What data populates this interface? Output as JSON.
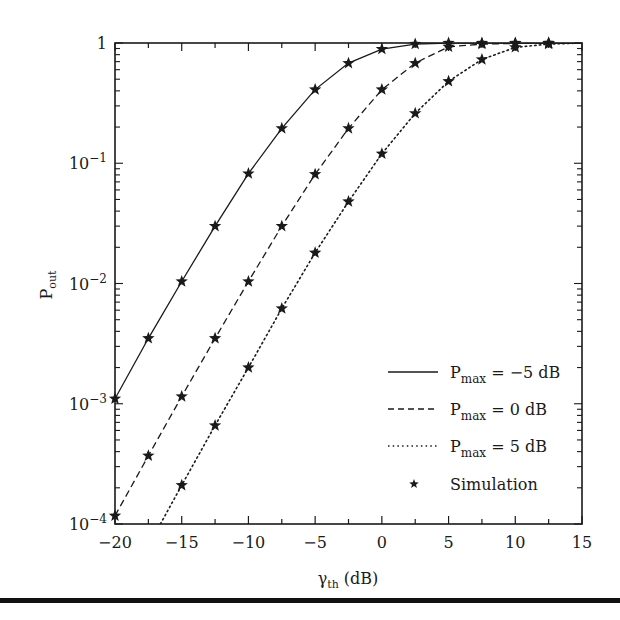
{
  "chart_data": {
    "type": "line",
    "title": "",
    "xlabel": "γth (dB)",
    "xlabel_main": "γ",
    "xlabel_sub": "th",
    "xlabel_unit": " (dB)",
    "ylabel": "Pout",
    "ylabel_main": "P",
    "ylabel_sub": "out",
    "xlim": [
      -20,
      15
    ],
    "ylim": [
      0.0001,
      1
    ],
    "yscale": "log",
    "xticks": [
      -20,
      -15,
      -10,
      -5,
      0,
      5,
      10,
      15
    ],
    "xtick_labels": [
      "−20",
      "−15",
      "−10",
      "−5",
      "0",
      "5",
      "10",
      "15"
    ],
    "yticks": [
      1,
      0.1,
      0.01,
      0.001,
      0.0001
    ],
    "ytick_labels": [
      {
        "base": "1",
        "exp": ""
      },
      {
        "base": "10",
        "exp": "−1"
      },
      {
        "base": "10",
        "exp": "−2"
      },
      {
        "base": "10",
        "exp": "−3"
      },
      {
        "base": "10",
        "exp": "−4"
      }
    ],
    "grid": false,
    "legend_position": "lower right",
    "series": [
      {
        "name": "Pmax = −5 dB",
        "label_main": "P",
        "label_sub": "max",
        "label_rest": " = −5 dB",
        "style": "solid",
        "x": [
          -20,
          -17.5,
          -15,
          -12.5,
          -10,
          -7.5,
          -5,
          -2.5,
          0,
          2.5,
          5,
          7.5,
          10,
          12.5,
          15
        ],
        "values": [
          0.0011,
          0.0035,
          0.0104,
          0.03,
          0.082,
          0.195,
          0.41,
          0.68,
          0.89,
          0.98,
          1.0,
          1.0,
          1.0,
          1.0,
          1.0
        ]
      },
      {
        "name": "Pmax = 0 dB",
        "label_main": "P",
        "label_sub": "max",
        "label_rest": " = 0 dB",
        "style": "dashed",
        "x": [
          -20,
          -17.5,
          -15,
          -12.5,
          -10,
          -7.5,
          -5,
          -2.5,
          0,
          2.5,
          5,
          7.5,
          10,
          12.5,
          15
        ],
        "values": [
          0.000117,
          0.00037,
          0.00115,
          0.0035,
          0.0104,
          0.03,
          0.081,
          0.195,
          0.41,
          0.68,
          0.93,
          0.98,
          0.99,
          1.0,
          1.0
        ]
      },
      {
        "name": "Pmax = 5 dB",
        "label_main": "P",
        "label_sub": "max",
        "label_rest": " = 5 dB",
        "style": "dotted",
        "x": [
          -16.6,
          -15,
          -12.5,
          -10,
          -7.5,
          -5,
          -2.5,
          0,
          2.5,
          5,
          7.5,
          10,
          12.5,
          15
        ],
        "values": [
          0.0001,
          0.00021,
          0.00066,
          0.002,
          0.0062,
          0.018,
          0.048,
          0.12,
          0.26,
          0.48,
          0.73,
          0.92,
          0.98,
          1.0
        ]
      }
    ],
    "simulation": {
      "name": "Simulation",
      "marker": "star",
      "points": [
        [
          [
            -20,
            0.0011
          ],
          [
            -17.5,
            0.0035
          ],
          [
            -15,
            0.0104
          ],
          [
            -12.5,
            0.03
          ],
          [
            -10,
            0.082
          ],
          [
            -7.5,
            0.195
          ],
          [
            -5,
            0.41
          ],
          [
            -2.5,
            0.68
          ],
          [
            0,
            0.89
          ],
          [
            2.5,
            0.98
          ],
          [
            5,
            1.0
          ],
          [
            7.5,
            1.0
          ],
          [
            10,
            1.0
          ],
          [
            12.5,
            1.0
          ]
        ],
        [
          [
            -20,
            0.000117
          ],
          [
            -17.5,
            0.00037
          ],
          [
            -15,
            0.00115
          ],
          [
            -12.5,
            0.0035
          ],
          [
            -10,
            0.0104
          ],
          [
            -7.5,
            0.03
          ],
          [
            -5,
            0.081
          ],
          [
            -2.5,
            0.195
          ],
          [
            0,
            0.41
          ],
          [
            2.5,
            0.68
          ],
          [
            5,
            0.93
          ],
          [
            7.5,
            0.98
          ],
          [
            10,
            0.99
          ],
          [
            12.5,
            1.0
          ]
        ],
        [
          [
            -15,
            0.00021
          ],
          [
            -12.5,
            0.00066
          ],
          [
            -10,
            0.002
          ],
          [
            -7.5,
            0.0062
          ],
          [
            -5,
            0.018
          ],
          [
            -2.5,
            0.048
          ],
          [
            0,
            0.12
          ],
          [
            2.5,
            0.26
          ],
          [
            5,
            0.48
          ],
          [
            7.5,
            0.73
          ],
          [
            10,
            0.92
          ],
          [
            12.5,
            0.98
          ]
        ]
      ]
    }
  },
  "legend": {
    "items": [
      {
        "main": "P",
        "sub": "max",
        "rest": " = −5 dB",
        "style": "solid"
      },
      {
        "main": "P",
        "sub": "max",
        "rest": " = 0 dB",
        "style": "dashed"
      },
      {
        "main": "P",
        "sub": "max",
        "rest": " = 5 dB",
        "style": "dotted"
      },
      {
        "text": "Simulation",
        "style": "star"
      }
    ]
  },
  "colors": {
    "ink": "#1a1a1a",
    "background": "#ffffff"
  }
}
